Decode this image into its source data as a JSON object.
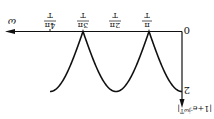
{
  "chart_data": {
    "type": "line",
    "orientation_note": "figure rendered rotated 180 degrees",
    "title": "",
    "xlabel": "ω",
    "ylabel": "|1+e^{-jωT}|",
    "origin_label": "0",
    "x_ticks": [
      "π/T",
      "2π/T",
      "3π/T",
      "4π/T"
    ],
    "y_ticks": [
      "2"
    ],
    "x": [
      0,
      0.5,
      1,
      1.5,
      2,
      2.5,
      3,
      3.5,
      4
    ],
    "x_unit": "π/T",
    "values": [
      2,
      1.414,
      0,
      1.414,
      2,
      1.414,
      0,
      1.414,
      2
    ],
    "ylim": [
      0,
      2
    ],
    "xlim": [
      0,
      4.3
    ],
    "grid": false,
    "legend": null
  },
  "labels": {
    "origin": "0",
    "x_axis": "ω",
    "y_axis": "|1+e",
    "y_axis_sup": "-jωT",
    "y_axis_end": "|",
    "y_tick": "2",
    "ticks": [
      {
        "num": "π",
        "den": "T"
      },
      {
        "num": "2π",
        "den": "T"
      },
      {
        "num": "3π",
        "den": "T"
      },
      {
        "num": "4π",
        "den": "T"
      }
    ]
  }
}
